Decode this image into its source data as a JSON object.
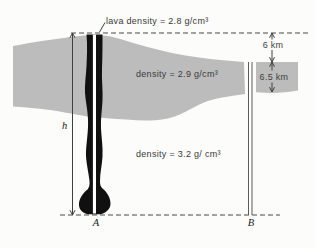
{
  "labels": {
    "lava_density": "lava density = 2.8 g/cm³",
    "upper_layer_density": "density = 2.9 g/cm³",
    "lower_layer_density": "density = 3.2 g/ cm³",
    "dim_top": "6 km",
    "dim_layer": "6.5 km",
    "height_var": "h",
    "point_a": "A",
    "point_b": "B"
  },
  "colors": {
    "background": "#fcfcfa",
    "band": "#bcbcbc",
    "ink": "#3f3f3f",
    "conduit": "#101010",
    "stripe": "#ffffff"
  }
}
